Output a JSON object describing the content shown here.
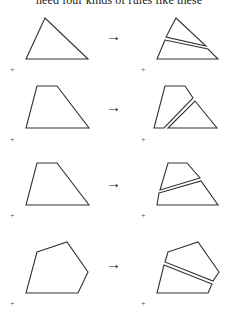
{
  "caption": "need four kinds of rules like these",
  "arrow_glyph": "→",
  "plus_glyph": "+",
  "rows": [
    {
      "left": "triangle",
      "right": "triangle-with-cut"
    },
    {
      "left": "trapezoid",
      "right": "trapezoid-with-diagonal-cut"
    },
    {
      "left": "trapezoid",
      "right": "trapezoid-with-horizontal-cut"
    },
    {
      "left": "pentagon",
      "right": "pentagon-with-cut"
    }
  ]
}
